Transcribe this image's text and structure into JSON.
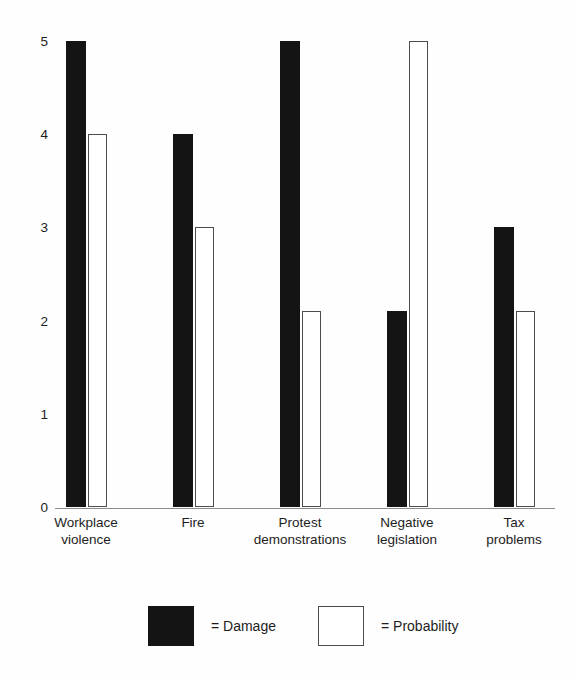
{
  "chart_data": {
    "type": "bar",
    "title": "",
    "subtitle": "",
    "xlabel": "",
    "ylabel": "",
    "ylim": [
      0,
      5
    ],
    "yticks": [
      "0",
      "1",
      "2",
      "3",
      "4",
      "5"
    ],
    "grid": false,
    "legend_position": "bottom",
    "categories": [
      "Workplace violence",
      "Fire",
      "Protest demonstrations",
      "Negative legislation",
      "Tax problems"
    ],
    "category_lines": [
      [
        "Workplace",
        "violence"
      ],
      [
        "Fire",
        ""
      ],
      [
        "Protest",
        "demonstrations"
      ],
      [
        "Negative",
        "legislation"
      ],
      [
        "Tax",
        "problems"
      ]
    ],
    "series": [
      {
        "name": "Damage",
        "color": "#141414",
        "style": "filled",
        "values": [
          5,
          4,
          5,
          2.1,
          3
        ]
      },
      {
        "name": "Probability",
        "color": "#ffffff",
        "style": "outline",
        "values": [
          4,
          3,
          2.1,
          5,
          2.1
        ]
      }
    ]
  },
  "legend": {
    "entries": [
      {
        "label": "= Damage",
        "swatch": "filled"
      },
      {
        "label": "= Probability",
        "swatch": "outline"
      }
    ]
  },
  "colors": {
    "background": "#fefefe",
    "damage_fill": "#141414",
    "probability_fill": "#ffffff",
    "probability_stroke": "#4d4d4d",
    "axis": "#8d8d8d",
    "text": "#1d1d1d"
  }
}
